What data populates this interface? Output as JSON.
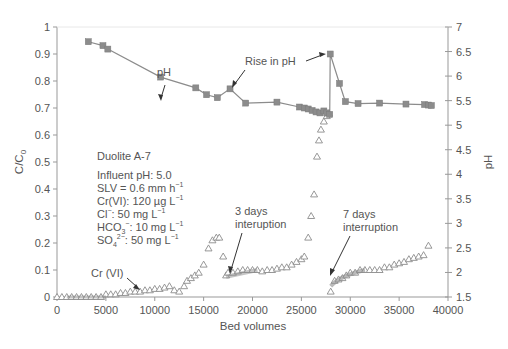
{
  "chart_data": {
    "type": "scatter",
    "title": "",
    "xlabel": "Bed volumes",
    "ylabel": "C/C0",
    "y2label": "pH",
    "xlim": [
      0,
      40000
    ],
    "ylim": [
      0,
      1
    ],
    "y2lim": [
      1.5,
      7
    ],
    "x_ticks": [
      "0",
      "5000",
      "10000",
      "15000",
      "20000",
      "25000",
      "30000",
      "35000",
      "40000"
    ],
    "y_ticks": [
      "0",
      "0.1",
      "0.2",
      "0.3",
      "0.4",
      "0.5",
      "0.6",
      "0.7",
      "0.8",
      "0.9",
      "1"
    ],
    "y2_ticks": [
      "1.5",
      "2",
      "2.5",
      "3",
      "3.5",
      "4",
      "4.5",
      "5",
      "5.5",
      "6",
      "6.5",
      "7"
    ],
    "grid": false,
    "series": [
      {
        "name": "pH",
        "axis": "right",
        "marker": "square",
        "line": true,
        "color": "#8c8c8c",
        "x": [
          3200,
          4700,
          5200,
          10600,
          14200,
          15300,
          16400,
          17700,
          19300,
          22500,
          24800,
          25300,
          25700,
          26100,
          26500,
          26900,
          27300,
          27600,
          27900,
          27950,
          28900,
          29500,
          30800,
          33000,
          35700,
          37600,
          38000,
          38300
        ],
        "y": [
          6.7,
          6.62,
          6.55,
          5.98,
          5.76,
          5.62,
          5.56,
          5.74,
          5.45,
          5.47,
          5.37,
          5.35,
          5.33,
          5.3,
          5.27,
          5.25,
          5.29,
          5.25,
          5.22,
          6.45,
          5.85,
          5.48,
          5.44,
          5.45,
          5.43,
          5.42,
          5.41,
          5.4
        ]
      },
      {
        "name": "Cr (VI)",
        "axis": "left",
        "marker": "triangle-open",
        "line": false,
        "color": "#8c8c8c",
        "x": [
          0,
          500,
          1000,
          1500,
          2000,
          2500,
          3000,
          3500,
          4000,
          4500,
          5000,
          5500,
          6000,
          6500,
          7000,
          7500,
          8000,
          8500,
          9000,
          9500,
          10000,
          10500,
          11000,
          11500,
          12000,
          12500,
          13000,
          13300,
          13700,
          14100,
          14500,
          15000,
          15500,
          15900,
          16300,
          16600,
          17000,
          17300,
          17500,
          18000,
          18500,
          19000,
          19500,
          20000,
          20500,
          21000,
          21500,
          22000,
          22500,
          23000,
          23500,
          24000,
          24500,
          25000,
          25300,
          25700,
          26000,
          26300,
          26600,
          26800,
          27000,
          27300,
          27600,
          27800,
          28000,
          28400,
          28800,
          29200,
          29600,
          30000,
          30500,
          31000,
          31500,
          32000,
          32500,
          33000,
          33500,
          34000,
          34500,
          35000,
          35500,
          36000,
          36500,
          37000,
          37500,
          38000
        ],
        "y": [
          0,
          0,
          0,
          0,
          0,
          0,
          0,
          0,
          0,
          0,
          0.01,
          0.01,
          0.01,
          0.015,
          0.015,
          0.02,
          0.02,
          0.02,
          0.025,
          0.025,
          0.03,
          0.03,
          0.035,
          0.04,
          0.025,
          0.02,
          0.04,
          0.06,
          0.07,
          0.08,
          0.09,
          0.12,
          0.18,
          0.21,
          0.22,
          0.22,
          0.15,
          0.08,
          0.09,
          0.09,
          0.095,
          0.1,
          0.1,
          0.1,
          0.1,
          0.095,
          0.1,
          0.1,
          0.105,
          0.11,
          0.11,
          0.12,
          0.13,
          0.14,
          0.15,
          0.22,
          0.3,
          0.38,
          0.52,
          0.58,
          0.62,
          0.65,
          0.67,
          0.68,
          0.02,
          0.06,
          0.065,
          0.07,
          0.08,
          0.09,
          0.09,
          0.1,
          0.1,
          0.1,
          0.1,
          0.1,
          0.11,
          0.11,
          0.12,
          0.125,
          0.13,
          0.14,
          0.145,
          0.15,
          0.155,
          0.19
        ]
      }
    ],
    "annotations": [
      {
        "text": "pH",
        "x": 10600,
        "y_ph": 6.35
      },
      {
        "text": "Rise in pH",
        "x": 21500,
        "y_ph": 6.3
      },
      {
        "text": "Cr (VI)",
        "x": 5500,
        "y": 0.07
      },
      {
        "text": "3 days interuption",
        "x": 19500,
        "y": 0.2
      },
      {
        "text": "7 days interruption",
        "x": 31500,
        "y": 0.2
      }
    ],
    "legend_position": "none"
  },
  "info_box": {
    "resin": "Duolite A-7",
    "influent_ph": "Influent pH: 5.0",
    "slv": "SLV = 0.6 mm h",
    "slv_sup": "−1",
    "crvi": "Cr(VI): 120 µg L",
    "crvi_sup": "−1",
    "cl_prefix": "Cl",
    "cl_sup1": "−",
    "cl_rest": ": 50 mg L",
    "cl_sup2": "−1",
    "hco_prefix": "HCO",
    "hco_sub": "3",
    "hco_sup1": "−",
    "hco_rest": ": 10 mg L",
    "hco_sup2": "−1",
    "so_prefix": "SO",
    "so_sub": "4",
    "so_sup1": "2−",
    "so_rest": ": 50 mg L",
    "so_sup2": "−1"
  },
  "labels": {
    "xlabel": "Bed volumes",
    "ylabel_main": "C/C",
    "ylabel_sub": "0",
    "y2label": "pH",
    "anno_ph": "pH",
    "anno_rise": "Rise in pH",
    "anno_cr": "Cr (VI)",
    "anno_3days_1": "3 days",
    "anno_3days_2": "interuption",
    "anno_7days_1": "7 days",
    "anno_7days_2": "interruption"
  }
}
